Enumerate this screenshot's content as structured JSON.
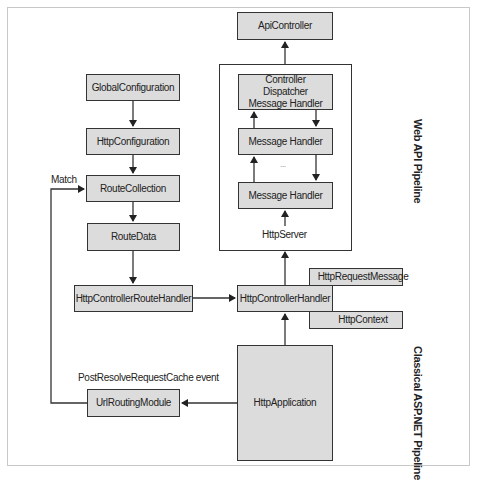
{
  "diagram": {
    "nodes": {
      "api_controller": "ApiController",
      "controller_dispatcher": "Controller Dispatcher Message Handler",
      "message_handler_1": "Message Handler",
      "message_handler_2": "Message Handler",
      "ellipsis": "...",
      "http_server": "HttpServer",
      "global_configuration": "GlobalConfiguration",
      "http_configuration": "HttpConfiguration",
      "route_collection": "RouteCollection",
      "route_data": "RouteData",
      "http_controller_route_handler": "HttpControllerRouteHandler",
      "http_controller_handler": "HttpControllerHandler",
      "http_request_message": "HttpRequestMessage",
      "http_context": "HttpContext",
      "http_application": "HttpApplication",
      "url_routing_module": "UrlRoutingModule"
    },
    "labels": {
      "match": "Match",
      "post_resolve_event": "PostResolveRequestCache event",
      "web_api_pipeline": "Web API Pipeline",
      "classical_pipeline": "Classical ASP.NET Pipeline"
    },
    "colors": {
      "box_fill": "#dcdcdc",
      "stroke": "#333333",
      "frame": "#c8c8c8"
    }
  }
}
